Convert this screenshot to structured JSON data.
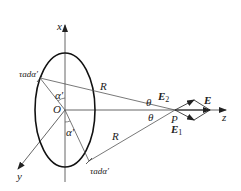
{
  "diagram": {
    "labels": {
      "x_axis": "x",
      "y_axis": "y",
      "z_axis": "z",
      "origin": "O",
      "point_P": "P",
      "R_upper": "R",
      "R_lower": "R",
      "theta_upper": "θ",
      "theta_lower": "θ",
      "alpha_upper": "α′",
      "alpha_lower": "α′",
      "charge_element_upper": "τadα′",
      "charge_element_lower": "τadα′",
      "E": "E",
      "E1": "E",
      "E1_sub": "1",
      "E2": "E",
      "E2_sub": "2"
    },
    "colors": {
      "line": "#444444",
      "ellipse": "#111111",
      "text": "#222222"
    }
  }
}
